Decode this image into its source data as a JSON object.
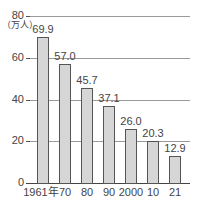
{
  "chart_data": {
    "type": "bar",
    "title": "",
    "xlabel": "",
    "ylabel": "（万人）",
    "unit": "（万人）",
    "ylim": [
      0,
      80
    ],
    "yticks": [
      0,
      20,
      40,
      60,
      80
    ],
    "grid": true,
    "categories": [
      "1961年",
      "70",
      "80",
      "90",
      "2000",
      "10",
      "21"
    ],
    "values": [
      69.9,
      57.0,
      45.7,
      37.1,
      26.0,
      20.3,
      12.9
    ],
    "value_labels": [
      "69.9",
      "57.0",
      "45.7",
      "37.1",
      "26.0",
      "20.3",
      "12.9"
    ],
    "bar_color": "#d6d6d6",
    "bar_border_color": "#555555",
    "gridline_color": "#9a9a9a"
  },
  "axis": {
    "y_tick_labels": [
      "80",
      "60",
      "40",
      "20",
      "0"
    ],
    "unit_label": "（万人）"
  }
}
